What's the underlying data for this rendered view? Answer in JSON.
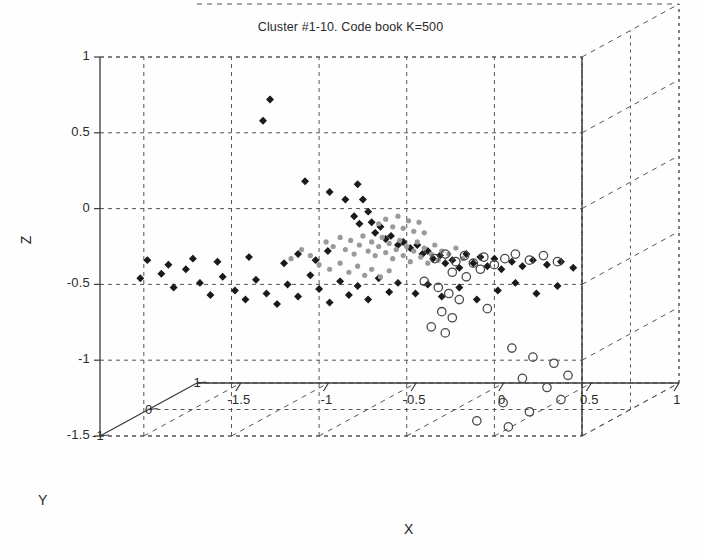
{
  "title": "Cluster #1-10. Code book K=500",
  "axes": {
    "x": {
      "name": "X",
      "ticks": [
        "-1.5",
        "-1",
        "-0.5",
        "0",
        "0.5",
        "1"
      ],
      "min": -1.75,
      "max": 1.0
    },
    "y": {
      "name": "Y",
      "ticks": [
        "1",
        "0",
        "-1"
      ],
      "min": -1,
      "max": 1
    },
    "z": {
      "name": "Z",
      "ticks": [
        "1",
        "0.5",
        "0",
        "-0.5",
        "-1",
        "-1.5"
      ],
      "min": -1.5,
      "max": 1.0
    }
  },
  "style": {
    "grid_color": "#555555",
    "axis_color": "#3a3a3a",
    "dark_marker_color": "#1a1a1a",
    "gray_marker_color": "#9a9a9a",
    "open_marker_color": "#4a4a4a",
    "background": "#fefefe"
  },
  "chart_data": {
    "type": "scatter",
    "title": "Cluster #1-10. Code book K=500",
    "xlabel": "X",
    "ylabel": "Y",
    "zlabel": "Z",
    "xlim": [
      -1.75,
      1.0
    ],
    "ylim": [
      -1,
      1
    ],
    "zlim": [
      -1.5,
      1.0
    ],
    "grid": true,
    "legend": "none",
    "projection": "3d",
    "series": [
      {
        "name": "dark-diamond-cluster",
        "marker": "diamond-filled",
        "color": "#1a1a1a",
        "points": [
          [
            -0.78,
            0.0,
            0.72
          ],
          [
            -0.82,
            0.0,
            0.58
          ],
          [
            -0.58,
            0.0,
            0.18
          ],
          [
            -0.44,
            0.0,
            0.11
          ],
          [
            -0.35,
            0.0,
            0.06
          ],
          [
            -0.28,
            0.0,
            0.16
          ],
          [
            -0.25,
            0.0,
            0.06
          ],
          [
            -0.22,
            0.0,
            -0.02
          ],
          [
            -0.3,
            0.0,
            -0.05
          ],
          [
            -0.27,
            0.0,
            -0.1
          ],
          [
            -0.2,
            0.0,
            -0.09
          ],
          [
            -0.18,
            0.0,
            -0.16
          ],
          [
            -0.15,
            0.0,
            -0.12
          ],
          [
            -0.12,
            0.0,
            -0.2
          ],
          [
            -0.09,
            0.0,
            -0.18
          ],
          [
            -0.05,
            0.0,
            -0.24
          ],
          [
            -0.02,
            0.0,
            -0.22
          ],
          [
            0.02,
            0.0,
            -0.26
          ],
          [
            0.06,
            0.0,
            -0.24
          ],
          [
            0.09,
            0.0,
            -0.3
          ],
          [
            0.12,
            0.0,
            -0.28
          ],
          [
            0.15,
            0.0,
            -0.33
          ],
          [
            0.19,
            0.0,
            -0.31
          ],
          [
            0.22,
            0.0,
            -0.36
          ],
          [
            0.26,
            0.0,
            -0.34
          ],
          [
            0.3,
            0.0,
            -0.39
          ],
          [
            0.34,
            0.0,
            -0.3
          ],
          [
            0.38,
            0.0,
            -0.36
          ],
          [
            0.42,
            0.0,
            -0.32
          ],
          [
            0.46,
            0.0,
            -0.38
          ],
          [
            0.5,
            0.0,
            -0.33
          ],
          [
            0.54,
            0.0,
            -0.4
          ],
          [
            0.6,
            0.0,
            -0.35
          ],
          [
            0.66,
            0.0,
            -0.38
          ],
          [
            0.72,
            0.0,
            -0.34
          ],
          [
            0.8,
            0.0,
            -0.37
          ],
          [
            0.88,
            0.0,
            -0.35
          ],
          [
            0.95,
            0.0,
            -0.39
          ],
          [
            -1.52,
            0.0,
            -0.46
          ],
          [
            -1.4,
            0.0,
            -0.43
          ],
          [
            -1.33,
            0.0,
            -0.52
          ],
          [
            -1.26,
            0.0,
            -0.4
          ],
          [
            -1.18,
            0.0,
            -0.49
          ],
          [
            -1.12,
            0.0,
            -0.57
          ],
          [
            -1.05,
            0.0,
            -0.45
          ],
          [
            -0.98,
            0.0,
            -0.54
          ],
          [
            -0.92,
            0.0,
            -0.6
          ],
          [
            -0.86,
            0.0,
            -0.47
          ],
          [
            -0.8,
            0.0,
            -0.56
          ],
          [
            -0.74,
            0.0,
            -0.63
          ],
          [
            -0.68,
            0.0,
            -0.5
          ],
          [
            -0.62,
            0.0,
            -0.58
          ],
          [
            -0.55,
            0.0,
            -0.44
          ],
          [
            -0.5,
            0.0,
            -0.53
          ],
          [
            -0.44,
            0.0,
            -0.62
          ],
          [
            -0.38,
            0.0,
            -0.48
          ],
          [
            -0.33,
            0.0,
            -0.57
          ],
          [
            -0.28,
            0.0,
            -0.51
          ],
          [
            -0.22,
            0.0,
            -0.6
          ],
          [
            -0.16,
            0.0,
            -0.46
          ],
          [
            -0.1,
            0.0,
            -0.55
          ],
          [
            -0.05,
            0.0,
            -0.49
          ],
          [
            0.05,
            0.0,
            -0.56
          ],
          [
            0.12,
            0.0,
            -0.5
          ],
          [
            0.2,
            0.0,
            -0.58
          ],
          [
            0.3,
            0.0,
            -0.52
          ],
          [
            0.4,
            0.0,
            -0.6
          ],
          [
            0.52,
            0.0,
            -0.54
          ],
          [
            0.62,
            0.0,
            -0.49
          ],
          [
            0.74,
            0.0,
            -0.56
          ],
          [
            0.86,
            0.0,
            -0.51
          ],
          [
            -0.62,
            0.0,
            -0.3
          ],
          [
            -0.52,
            0.0,
            -0.34
          ],
          [
            -0.45,
            0.0,
            -0.28
          ],
          [
            -0.7,
            0.0,
            -0.36
          ],
          [
            -0.9,
            0.0,
            -0.32
          ],
          [
            -1.08,
            0.0,
            -0.35
          ],
          [
            -1.22,
            0.0,
            -0.33
          ],
          [
            -1.36,
            0.0,
            -0.37
          ],
          [
            -1.48,
            0.0,
            -0.34
          ]
        ]
      },
      {
        "name": "light-gray-core",
        "marker": "dot-filled",
        "color": "#9a9a9a",
        "points": [
          [
            -0.46,
            0.0,
            -0.22
          ],
          [
            -0.42,
            0.0,
            -0.25
          ],
          [
            -0.38,
            0.0,
            -0.19
          ],
          [
            -0.35,
            0.0,
            -0.27
          ],
          [
            -0.32,
            0.0,
            -0.21
          ],
          [
            -0.3,
            0.0,
            -0.3
          ],
          [
            -0.27,
            0.0,
            -0.24
          ],
          [
            -0.25,
            0.0,
            -0.18
          ],
          [
            -0.22,
            0.0,
            -0.28
          ],
          [
            -0.2,
            0.0,
            -0.22
          ],
          [
            -0.18,
            0.0,
            -0.31
          ],
          [
            -0.16,
            0.0,
            -0.25
          ],
          [
            -0.14,
            0.0,
            -0.19
          ],
          [
            -0.12,
            0.0,
            -0.29
          ],
          [
            -0.1,
            0.0,
            -0.23
          ],
          [
            -0.08,
            0.0,
            -0.33
          ],
          [
            -0.06,
            0.0,
            -0.27
          ],
          [
            -0.04,
            0.0,
            -0.21
          ],
          [
            -0.02,
            0.0,
            -0.31
          ],
          [
            0.0,
            0.0,
            -0.25
          ],
          [
            0.02,
            0.0,
            -0.35
          ],
          [
            0.04,
            0.0,
            -0.28
          ],
          [
            0.06,
            0.0,
            -0.22
          ],
          [
            0.08,
            0.0,
            -0.32
          ],
          [
            0.1,
            0.0,
            -0.26
          ],
          [
            0.12,
            0.0,
            -0.36
          ],
          [
            0.14,
            0.0,
            -0.3
          ],
          [
            0.16,
            0.0,
            -0.24
          ],
          [
            0.18,
            0.0,
            -0.34
          ],
          [
            0.2,
            0.0,
            -0.28
          ],
          [
            -0.16,
            0.0,
            -0.1
          ],
          [
            -0.12,
            0.0,
            -0.07
          ],
          [
            -0.08,
            0.0,
            -0.12
          ],
          [
            -0.05,
            0.0,
            -0.05
          ],
          [
            -0.02,
            0.0,
            -0.13
          ],
          [
            0.01,
            0.0,
            -0.08
          ],
          [
            0.04,
            0.0,
            -0.15
          ],
          [
            0.07,
            0.0,
            -0.09
          ],
          [
            0.1,
            0.0,
            -0.16
          ],
          [
            -0.55,
            0.0,
            -0.31
          ],
          [
            -0.6,
            0.0,
            -0.27
          ],
          [
            -0.66,
            0.0,
            -0.33
          ],
          [
            -0.5,
            0.0,
            -0.37
          ],
          [
            -0.44,
            0.0,
            -0.4
          ],
          [
            -0.38,
            0.0,
            -0.36
          ],
          [
            -0.33,
            0.0,
            -0.42
          ],
          [
            -0.28,
            0.0,
            -0.38
          ],
          [
            -0.24,
            0.0,
            -0.44
          ],
          [
            -0.2,
            0.0,
            -0.4
          ],
          [
            -0.15,
            0.0,
            -0.45
          ],
          [
            -0.1,
            0.0,
            -0.41
          ],
          [
            0.24,
            0.0,
            -0.3
          ],
          [
            0.28,
            0.0,
            -0.26
          ],
          [
            0.32,
            0.0,
            -0.33
          ]
        ]
      },
      {
        "name": "open-circle-cluster",
        "marker": "circle-open",
        "color": "#4a4a4a",
        "points": [
          [
            0.16,
            0.0,
            -0.33
          ],
          [
            0.22,
            0.0,
            -0.3
          ],
          [
            0.28,
            0.0,
            -0.35
          ],
          [
            0.33,
            0.0,
            -0.31
          ],
          [
            0.38,
            0.0,
            -0.36
          ],
          [
            0.44,
            0.0,
            -0.32
          ],
          [
            0.5,
            0.0,
            -0.37
          ],
          [
            0.56,
            0.0,
            -0.33
          ],
          [
            0.62,
            0.0,
            -0.3
          ],
          [
            0.7,
            0.0,
            -0.34
          ],
          [
            0.78,
            0.0,
            -0.31
          ],
          [
            0.86,
            0.0,
            -0.35
          ],
          [
            0.26,
            0.0,
            -0.42
          ],
          [
            0.34,
            0.0,
            -0.45
          ],
          [
            0.42,
            0.0,
            -0.4
          ],
          [
            0.1,
            0.0,
            -0.48
          ],
          [
            0.18,
            0.0,
            -0.52
          ],
          [
            0.24,
            0.0,
            -0.56
          ],
          [
            0.3,
            0.0,
            -0.6
          ],
          [
            0.2,
            0.0,
            -0.68
          ],
          [
            0.26,
            0.0,
            -0.72
          ],
          [
            0.14,
            0.0,
            -0.78
          ],
          [
            0.22,
            0.0,
            -0.82
          ],
          [
            0.46,
            0.0,
            -0.66
          ],
          [
            0.6,
            0.0,
            -0.92
          ],
          [
            0.72,
            0.0,
            -0.98
          ],
          [
            0.84,
            0.0,
            -1.02
          ],
          [
            0.66,
            0.0,
            -1.12
          ],
          [
            0.8,
            0.0,
            -1.18
          ],
          [
            0.92,
            0.0,
            -1.1
          ],
          [
            0.55,
            0.0,
            -1.28
          ],
          [
            0.7,
            0.0,
            -1.34
          ],
          [
            0.88,
            0.0,
            -1.26
          ],
          [
            0.4,
            0.0,
            -1.4
          ],
          [
            0.58,
            0.0,
            -1.44
          ]
        ]
      }
    ]
  }
}
